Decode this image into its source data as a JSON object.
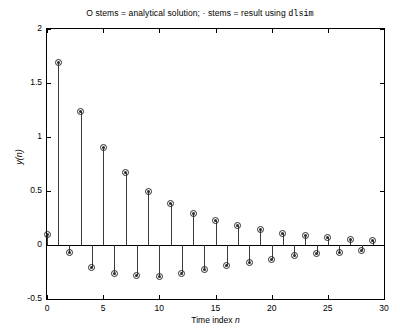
{
  "chart_data": {
    "type": "stem",
    "title_parts": {
      "before": "O stems = analytical solution; · stems = result using ",
      "mono": "dlsim"
    },
    "title": "O stems = analytical solution; · stems = result using dlsim",
    "xlabel_text": "Time index ",
    "xlabel_italic": "n",
    "xlabel": "Time index n",
    "ylabel_text": "y(n)",
    "ylabel_pre": "y",
    "ylabel_post": "(n)",
    "xlim": [
      0,
      30
    ],
    "ylim": [
      -0.5,
      2
    ],
    "xticks": [
      0,
      5,
      10,
      15,
      20,
      25,
      30
    ],
    "xticklabels": [
      "0",
      "5",
      "10",
      "15",
      "20",
      "25",
      "30"
    ],
    "yticks": [
      -0.5,
      0,
      0.5,
      1,
      1.5,
      2
    ],
    "yticklabels": [
      "-0.5",
      "0",
      "0.5",
      "1",
      "1.5",
      "2"
    ],
    "grid": false,
    "legend": null,
    "marker_outer": "circle-open",
    "marker_inner": "dot",
    "series": [
      {
        "name": "analytical solution (O stems)",
        "x": [
          0,
          1,
          2,
          3,
          4,
          5,
          6,
          7,
          8,
          9,
          10,
          11,
          12,
          13,
          14,
          15,
          16,
          17,
          18,
          19,
          20,
          21,
          22,
          23,
          24,
          25,
          26,
          27,
          28,
          29
        ],
        "values": [
          0.1,
          1.69,
          -0.07,
          1.24,
          -0.21,
          0.9,
          -0.26,
          0.67,
          -0.28,
          0.5,
          -0.29,
          0.38,
          -0.26,
          0.29,
          -0.23,
          0.23,
          -0.19,
          0.18,
          -0.16,
          0.14,
          -0.13,
          0.11,
          -0.1,
          0.09,
          -0.08,
          0.07,
          -0.065,
          0.055,
          -0.05,
          0.045
        ]
      },
      {
        "name": "result using dlsim (· stems)",
        "x": [
          0,
          1,
          2,
          3,
          4,
          5,
          6,
          7,
          8,
          9,
          10,
          11,
          12,
          13,
          14,
          15,
          16,
          17,
          18,
          19,
          20,
          21,
          22,
          23,
          24,
          25,
          26,
          27,
          28,
          29
        ],
        "values": [
          0.1,
          1.69,
          -0.07,
          1.24,
          -0.21,
          0.9,
          -0.26,
          0.67,
          -0.28,
          0.5,
          -0.29,
          0.38,
          -0.26,
          0.29,
          -0.23,
          0.23,
          -0.19,
          0.18,
          -0.16,
          0.14,
          -0.13,
          0.11,
          -0.1,
          0.09,
          -0.08,
          0.07,
          -0.065,
          0.055,
          -0.05,
          0.045
        ]
      }
    ]
  }
}
